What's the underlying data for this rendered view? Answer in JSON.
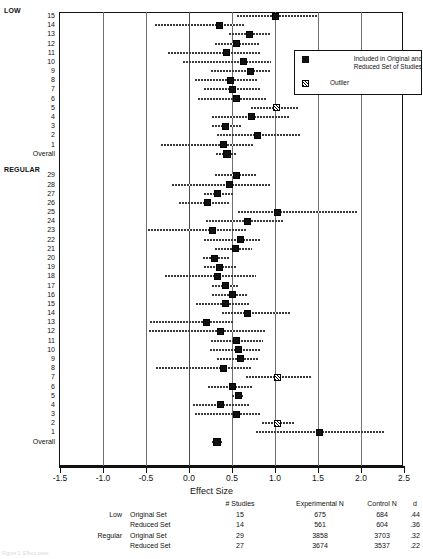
{
  "chart_data": {
    "type": "forest",
    "title": "",
    "xlabel": "Effect Size",
    "ylabel": "",
    "xlim": [
      -1.5,
      2.5
    ],
    "xticks": [
      -1.5,
      -1.0,
      -0.5,
      0.0,
      0.5,
      1.0,
      1.5,
      2.0,
      2.5
    ],
    "xticklabels": [
      "-1.5",
      "-1.0",
      "-0.5",
      "0.0",
      "0.5",
      "1.0",
      "1.5",
      "2.0",
      "2.5"
    ],
    "grid": "vertical gridlines at each 0.5 tick",
    "legend_position": "upper right inside plot",
    "groups": [
      {
        "name": "LOW",
        "rows": [
          {
            "label": "15",
            "effect": 1.0,
            "low": 0.56,
            "high": 1.5,
            "outlier": false
          },
          {
            "label": "14",
            "effect": 0.36,
            "low": -0.4,
            "high": 0.64,
            "outlier": false
          },
          {
            "label": "13",
            "effect": 0.7,
            "low": 0.47,
            "high": 0.94,
            "outlier": false
          },
          {
            "label": "12",
            "effect": 0.55,
            "low": 0.3,
            "high": 0.82,
            "outlier": false
          },
          {
            "label": "11",
            "effect": 0.44,
            "low": -0.25,
            "high": 0.83,
            "outlier": false
          },
          {
            "label": "10",
            "effect": 0.63,
            "low": -0.07,
            "high": 0.95,
            "outlier": false
          },
          {
            "label": "9",
            "effect": 0.72,
            "low": 0.25,
            "high": 0.95,
            "outlier": false
          },
          {
            "label": "8",
            "effect": 0.48,
            "low": 0.07,
            "high": 0.8,
            "outlier": false
          },
          {
            "label": "7",
            "effect": 0.5,
            "low": 0.18,
            "high": 0.84,
            "outlier": false
          },
          {
            "label": "6",
            "effect": 0.55,
            "low": 0.1,
            "high": 0.9,
            "outlier": false
          },
          {
            "label": "5",
            "effect": 1.02,
            "low": 0.72,
            "high": 1.28,
            "outlier": true
          },
          {
            "label": "4",
            "effect": 0.73,
            "low": 0.27,
            "high": 1.18,
            "outlier": false
          },
          {
            "label": "3",
            "effect": 0.42,
            "low": 0.27,
            "high": 0.6,
            "outlier": false
          },
          {
            "label": "2",
            "effect": 0.8,
            "low": 0.33,
            "high": 1.3,
            "outlier": false
          },
          {
            "label": "1",
            "effect": 0.4,
            "low": -0.32,
            "high": 0.75,
            "outlier": false
          },
          {
            "label": "Overall",
            "effect": 0.44,
            "low": 0.31,
            "high": 0.56,
            "outlier": false
          }
        ]
      },
      {
        "name": "REGULAR",
        "rows": [
          {
            "label": "29",
            "effect": 0.55,
            "low": 0.3,
            "high": 0.78,
            "outlier": false
          },
          {
            "label": "28",
            "effect": 0.47,
            "low": -0.2,
            "high": 0.95,
            "outlier": false
          },
          {
            "label": "27",
            "effect": 0.33,
            "low": 0.18,
            "high": 0.52,
            "outlier": false
          },
          {
            "label": "26",
            "effect": 0.22,
            "low": -0.12,
            "high": 0.48,
            "outlier": false
          },
          {
            "label": "25",
            "effect": 1.03,
            "low": 0.57,
            "high": 1.95,
            "outlier": false
          },
          {
            "label": "24",
            "effect": 0.68,
            "low": 0.2,
            "high": 1.1,
            "outlier": false
          },
          {
            "label": "23",
            "effect": 0.27,
            "low": -0.48,
            "high": 0.68,
            "outlier": false
          },
          {
            "label": "22",
            "effect": 0.6,
            "low": 0.18,
            "high": 0.82,
            "outlier": false
          },
          {
            "label": "21",
            "effect": 0.54,
            "low": 0.3,
            "high": 0.73,
            "outlier": false
          },
          {
            "label": "20",
            "effect": 0.3,
            "low": 0.16,
            "high": 0.46,
            "outlier": false
          },
          {
            "label": "19",
            "effect": 0.36,
            "low": 0.18,
            "high": 0.55,
            "outlier": false
          },
          {
            "label": "18",
            "effect": 0.33,
            "low": -0.28,
            "high": 0.78,
            "outlier": false
          },
          {
            "label": "17",
            "effect": 0.42,
            "low": 0.27,
            "high": 0.58,
            "outlier": false
          },
          {
            "label": "16",
            "effect": 0.5,
            "low": 0.27,
            "high": 0.68,
            "outlier": false
          },
          {
            "label": "15",
            "effect": 0.43,
            "low": 0.08,
            "high": 0.7,
            "outlier": false
          },
          {
            "label": "14",
            "effect": 0.68,
            "low": 0.38,
            "high": 1.18,
            "outlier": false
          },
          {
            "label": "13",
            "effect": 0.2,
            "low": -0.45,
            "high": 0.52,
            "outlier": false
          },
          {
            "label": "12",
            "effect": 0.37,
            "low": -0.47,
            "high": 0.88,
            "outlier": false
          },
          {
            "label": "11",
            "effect": 0.55,
            "low": 0.26,
            "high": 0.86,
            "outlier": false
          },
          {
            "label": "10",
            "effect": 0.57,
            "low": 0.24,
            "high": 0.82,
            "outlier": false
          },
          {
            "label": "9",
            "effect": 0.6,
            "low": 0.32,
            "high": 0.8,
            "outlier": false
          },
          {
            "label": "8",
            "effect": 0.4,
            "low": -0.38,
            "high": 0.72,
            "outlier": false
          },
          {
            "label": "7",
            "effect": 1.03,
            "low": 0.66,
            "high": 1.42,
            "outlier": true
          },
          {
            "label": "6",
            "effect": 0.5,
            "low": 0.22,
            "high": 0.75,
            "outlier": false
          },
          {
            "label": "5",
            "effect": 0.57,
            "low": 0.5,
            "high": 0.64,
            "outlier": false
          },
          {
            "label": "4",
            "effect": 0.37,
            "low": 0.05,
            "high": 0.7,
            "outlier": false
          },
          {
            "label": "3",
            "effect": 0.55,
            "low": 0.07,
            "high": 0.82,
            "outlier": false
          },
          {
            "label": "2",
            "effect": 1.03,
            "low": 0.85,
            "high": 1.22,
            "outlier": true
          },
          {
            "label": "1",
            "effect": 1.52,
            "low": 0.78,
            "high": 2.28,
            "outlier": false
          },
          {
            "label": "Overall",
            "effect": 0.32,
            "low": 0.27,
            "high": 0.38,
            "outlier": false
          }
        ]
      }
    ],
    "legend": [
      {
        "marker": "solid-square",
        "label": "Included in Original and Reduced Set of Studies"
      },
      {
        "marker": "hatched-square",
        "label": "Outlier"
      }
    ],
    "summary_table": {
      "columns": [
        "",
        "",
        "# Studies",
        "Experimental N",
        "Control N",
        "d"
      ],
      "rows": [
        {
          "group": "Low",
          "set": "Original Set",
          "studies": "15",
          "experimental_n": "675",
          "control_n": "684",
          "d": ".44"
        },
        {
          "group": "",
          "set": "Reduced Set",
          "studies": "14",
          "experimental_n": "561",
          "control_n": "604",
          "d": ".36"
        },
        {
          "group": "Regular",
          "set": "Original Set",
          "studies": "29",
          "experimental_n": "3858",
          "control_n": "3703",
          "d": ".32"
        },
        {
          "group": "",
          "set": "Reduced Set",
          "studies": "27",
          "experimental_n": "3674",
          "control_n": "3537",
          "d": ".22"
        }
      ]
    }
  },
  "caption": "Figure 1.  Effect sizes"
}
